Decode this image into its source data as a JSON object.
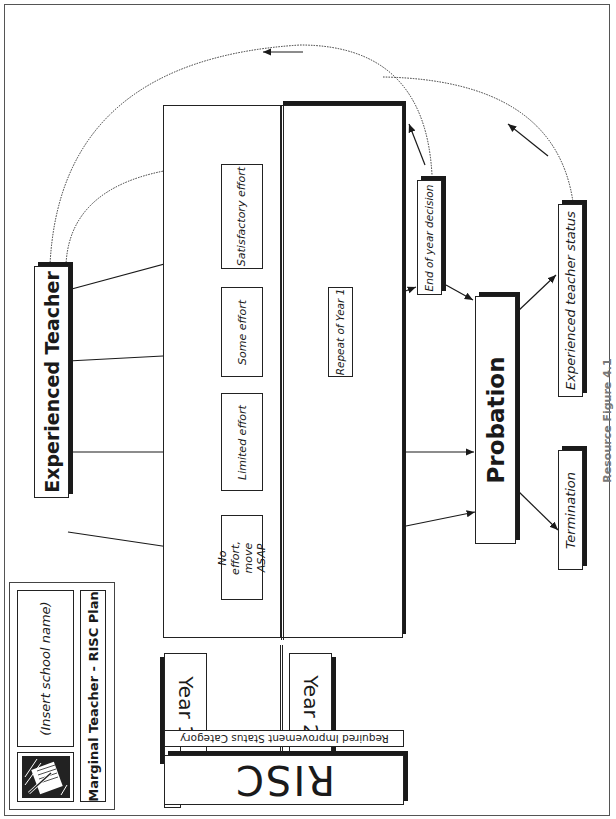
{
  "header": {
    "school_name_placeholder": "(Insert school name)",
    "plan_title": "Marginal Teacher - RISC Plan",
    "logo_icon": "pen-and-papers-icon"
  },
  "legend": {
    "acronym": "RISC",
    "acronym_full": "Required Improvement Status Category",
    "year_labels": [
      "Year 1",
      "Year 2"
    ]
  },
  "nodes": {
    "start": "Experienced Teacher",
    "year1": [
      "No effort, move ASAP",
      "Limited effort",
      "Some effort",
      "Satisfactory effort"
    ],
    "year2": [
      "Repeat of Year 1"
    ],
    "decision": "End of year decision",
    "probation": "Probation",
    "outcomes": [
      "Termination",
      "Experienced teacher status"
    ]
  },
  "footer": {
    "caption": "Resource Figure 4.1"
  },
  "colors": {
    "ink": "#1a1a1a",
    "border": "#555555",
    "background": "#ffffff"
  }
}
